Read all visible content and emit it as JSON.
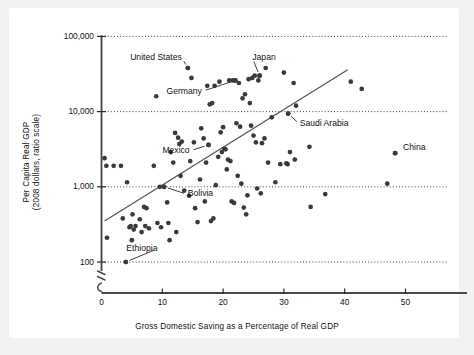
{
  "chart_data": {
    "type": "scatter",
    "title": "",
    "xlabel": "Gross Domestic Saving as a Percentage of Real GDP",
    "ylabel": "Per Capita Real GDP\n(2008 dollars, ratio scale)",
    "ylabel_line1": "Per Capita Real GDP",
    "ylabel_line2": "(2008 dollars, ratio scale)",
    "yscale": "log",
    "xscale": "linear",
    "xlim": [
      0,
      56
    ],
    "ylim": [
      100,
      100000
    ],
    "grid": "horizontal dotted gridlines at each decade",
    "legend": "none",
    "axis_break": true,
    "xticks": [
      "0",
      "10",
      "20",
      "30",
      "40",
      "50"
    ],
    "xtick_values": [
      0,
      10,
      20,
      30,
      40,
      50
    ],
    "yticks": [
      "100",
      "1,000",
      "10,000",
      "100,000"
    ],
    "ytick_values": [
      100,
      1000,
      10000,
      100000
    ],
    "point_color": "#3a3a3a",
    "line_color": "#555555",
    "trendline": {
      "x_start": 0.5,
      "y_start": 350,
      "x_end": 40.5,
      "y_end": 36000
    },
    "annotations": [
      {
        "label": "United States",
        "label_x": 13.2,
        "label_y": 52000,
        "point_x": 14.2,
        "point_y": 38000,
        "leader": true
      },
      {
        "label": "Japan",
        "label_x": 24.8,
        "label_y": 52000,
        "point_x": 26.0,
        "point_y": 30000,
        "leader": true
      },
      {
        "label": "Germany",
        "label_x": 16.5,
        "label_y": 18500,
        "point_x": 22.0,
        "point_y": 26000,
        "leader": true
      },
      {
        "label": "Saudi Arabia",
        "label_x": 32.6,
        "label_y": 6800,
        "point_x": 30.7,
        "point_y": 9400,
        "leader": true
      },
      {
        "label": "China",
        "label_x": 49.6,
        "label_y": 3300,
        "point_x": 48.3,
        "point_y": 2800,
        "leader": false
      },
      {
        "label": "Mexico",
        "label_x": 14.5,
        "label_y": 3000,
        "point_x": 17.6,
        "point_y": 3600,
        "leader": true
      },
      {
        "label": "Bolivia",
        "label_x": 14.2,
        "label_y": 790,
        "point_x": 10.3,
        "point_y": 1000,
        "leader": true
      },
      {
        "label": "Ethiopia",
        "label_x": 9.2,
        "label_y": 150,
        "point_x": 4.0,
        "point_y": 100,
        "leader": true
      }
    ],
    "points": [
      [
        0.5,
        2400
      ],
      [
        0.8,
        1900
      ],
      [
        0.9,
        210
      ],
      [
        2.0,
        1900
      ],
      [
        3.2,
        1900
      ],
      [
        3.5,
        380
      ],
      [
        4.0,
        100
      ],
      [
        4.2,
        1150
      ],
      [
        4.6,
        290
      ],
      [
        4.8,
        300
      ],
      [
        5.0,
        195
      ],
      [
        5.1,
        430
      ],
      [
        5.3,
        270
      ],
      [
        5.6,
        300
      ],
      [
        6.3,
        370
      ],
      [
        6.6,
        250
      ],
      [
        7.0,
        540
      ],
      [
        7.2,
        300
      ],
      [
        7.4,
        520
      ],
      [
        7.8,
        280
      ],
      [
        8.6,
        1900
      ],
      [
        9.0,
        16000
      ],
      [
        9.2,
        330
      ],
      [
        9.6,
        1000
      ],
      [
        9.8,
        290
      ],
      [
        10.3,
        1000
      ],
      [
        10.8,
        620
      ],
      [
        11.0,
        330
      ],
      [
        11.2,
        195
      ],
      [
        11.4,
        2900
      ],
      [
        11.8,
        2100
      ],
      [
        12.1,
        5200
      ],
      [
        12.3,
        250
      ],
      [
        12.6,
        4500
      ],
      [
        12.8,
        3700
      ],
      [
        13.0,
        1400
      ],
      [
        13.2,
        4000
      ],
      [
        13.6,
        890
      ],
      [
        14.2,
        38000
      ],
      [
        14.4,
        760
      ],
      [
        14.6,
        2200
      ],
      [
        14.8,
        28000
      ],
      [
        15.2,
        3900
      ],
      [
        15.4,
        520
      ],
      [
        15.8,
        340
      ],
      [
        16.2,
        1250
      ],
      [
        16.4,
        6000
      ],
      [
        16.8,
        4400
      ],
      [
        17.0,
        640
      ],
      [
        17.2,
        2100
      ],
      [
        17.4,
        22000
      ],
      [
        17.6,
        3600
      ],
      [
        17.8,
        12500
      ],
      [
        18.0,
        350
      ],
      [
        18.2,
        13000
      ],
      [
        18.4,
        380
      ],
      [
        18.6,
        22000
      ],
      [
        18.8,
        1050
      ],
      [
        19.2,
        2500
      ],
      [
        19.4,
        25000
      ],
      [
        19.6,
        5300
      ],
      [
        19.8,
        2900
      ],
      [
        20.0,
        6200
      ],
      [
        20.2,
        3200
      ],
      [
        20.4,
        3150
      ],
      [
        20.6,
        1700
      ],
      [
        20.8,
        2300
      ],
      [
        21.0,
        26000
      ],
      [
        21.2,
        2200
      ],
      [
        21.4,
        640
      ],
      [
        21.6,
        26000
      ],
      [
        21.8,
        610
      ],
      [
        22.0,
        26000
      ],
      [
        22.2,
        7000
      ],
      [
        22.4,
        1400
      ],
      [
        22.6,
        24000
      ],
      [
        22.8,
        6300
      ],
      [
        23.0,
        1100
      ],
      [
        23.2,
        15000
      ],
      [
        23.4,
        530
      ],
      [
        23.6,
        17000
      ],
      [
        23.8,
        430
      ],
      [
        24.0,
        770
      ],
      [
        24.2,
        27000
      ],
      [
        24.4,
        13000
      ],
      [
        24.6,
        6500
      ],
      [
        24.8,
        28000
      ],
      [
        25.0,
        4800
      ],
      [
        25.2,
        30000
      ],
      [
        25.4,
        3900
      ],
      [
        25.6,
        950
      ],
      [
        25.8,
        26000
      ],
      [
        26.0,
        30000
      ],
      [
        26.2,
        820
      ],
      [
        26.4,
        3800
      ],
      [
        26.8,
        4400
      ],
      [
        27.0,
        38000
      ],
      [
        27.4,
        2100
      ],
      [
        28.0,
        8400
      ],
      [
        28.6,
        1150
      ],
      [
        29.4,
        2000
      ],
      [
        30.0,
        33000
      ],
      [
        30.4,
        2050
      ],
      [
        30.6,
        2000
      ],
      [
        30.7,
        9400
      ],
      [
        31.0,
        2900
      ],
      [
        31.6,
        24000
      ],
      [
        31.8,
        2300
      ],
      [
        32.0,
        12000
      ],
      [
        34.2,
        3400
      ],
      [
        34.4,
        540
      ],
      [
        36.8,
        800
      ],
      [
        41.0,
        25000
      ],
      [
        42.8,
        20000
      ],
      [
        47.0,
        1100
      ],
      [
        48.3,
        2800
      ]
    ]
  }
}
